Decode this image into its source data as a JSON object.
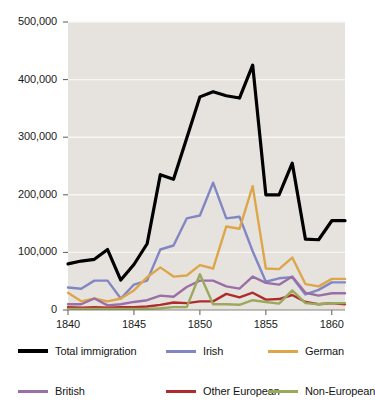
{
  "chart_data": {
    "type": "line",
    "title": "",
    "subtitle": "",
    "xlabel": "",
    "ylabel": "",
    "xlim": [
      1840,
      1861
    ],
    "ylim": [
      0,
      500000
    ],
    "x_ticks": [
      1840,
      1845,
      1850,
      1855,
      1860
    ],
    "x_tick_labels": [
      "1840",
      "1845",
      "1850",
      "1855",
      "1860"
    ],
    "y_ticks": [
      0,
      100000,
      200000,
      300000,
      400000,
      500000
    ],
    "y_tick_labels": [
      "0",
      "100,000",
      "200,000",
      "300,000",
      "400,000",
      "500,000"
    ],
    "grid": "horizontal",
    "legend_position": "bottom",
    "plot_background": "#e6e3de",
    "gridline_color": "#f7f6f3",
    "x": [
      1840,
      1841,
      1842,
      1843,
      1844,
      1845,
      1846,
      1847,
      1848,
      1849,
      1850,
      1851,
      1852,
      1853,
      1854,
      1855,
      1856,
      1857,
      1858,
      1859,
      1860,
      1861
    ],
    "series": [
      {
        "name": "Total immigration",
        "color": "#000000",
        "width": 3.2,
        "values": [
          80000,
          85000,
          88000,
          105000,
          52000,
          79000,
          115000,
          235000,
          227000,
          298000,
          370000,
          379000,
          372000,
          368000,
          425000,
          200000,
          200000,
          255000,
          123000,
          122000,
          155000,
          155000
        ]
      },
      {
        "name": "Irish",
        "color": "#8287c4",
        "width": 2.4,
        "values": [
          39000,
          37000,
          51000,
          51000,
          20000,
          44000,
          51000,
          105000,
          112000,
          159000,
          164000,
          221000,
          159000,
          162000,
          102000,
          49000,
          55000,
          57000,
          27000,
          35000,
          48000,
          48000
        ]
      },
      {
        "name": "German",
        "color": "#dda64b",
        "width": 2.4,
        "values": [
          30000,
          15000,
          20000,
          15000,
          20000,
          34000,
          57000,
          74000,
          58000,
          60000,
          78000,
          72000,
          145000,
          141000,
          215000,
          72000,
          71000,
          91000,
          45000,
          41000,
          54000,
          54000
        ]
      },
      {
        "name": "British",
        "color": "#9a6fa8",
        "width": 2.4,
        "values": [
          10000,
          10000,
          20000,
          8000,
          10000,
          14000,
          17000,
          25000,
          23000,
          40000,
          51000,
          51000,
          41000,
          37000,
          58000,
          47000,
          44000,
          58000,
          30000,
          25000,
          29000,
          29000
        ]
      },
      {
        "name": "Other European",
        "color": "#ae2c2c",
        "width": 2.4,
        "values": [
          5000,
          4000,
          5000,
          4000,
          5000,
          5000,
          6000,
          9000,
          13000,
          12000,
          15000,
          15000,
          28000,
          22000,
          30000,
          18000,
          19000,
          26000,
          14000,
          10000,
          12000,
          10000
        ]
      },
      {
        "name": "Non-European",
        "color": "#9aa95c",
        "width": 2.4,
        "values": [
          2000,
          2000,
          2000,
          2000,
          2000,
          2000,
          2000,
          3000,
          5000,
          5000,
          62000,
          10000,
          10000,
          9000,
          17000,
          14000,
          11000,
          34000,
          12000,
          10000,
          12000,
          12000
        ]
      }
    ]
  },
  "legend": {
    "rows": [
      [
        {
          "label": "Total immigration",
          "color": "#000000",
          "icon": "line-swatch-black"
        },
        {
          "label": "Irish",
          "color": "#8287c4",
          "icon": "line-swatch-blue"
        },
        {
          "label": "German",
          "color": "#dda64b",
          "icon": "line-swatch-orange"
        }
      ],
      [
        {
          "label": "British",
          "color": "#9a6fa8",
          "icon": "line-swatch-purple"
        },
        {
          "label": "Other European",
          "color": "#ae2c2c",
          "icon": "line-swatch-red"
        },
        {
          "label": "Non-European",
          "color": "#9aa95c",
          "icon": "line-swatch-green"
        }
      ]
    ]
  }
}
